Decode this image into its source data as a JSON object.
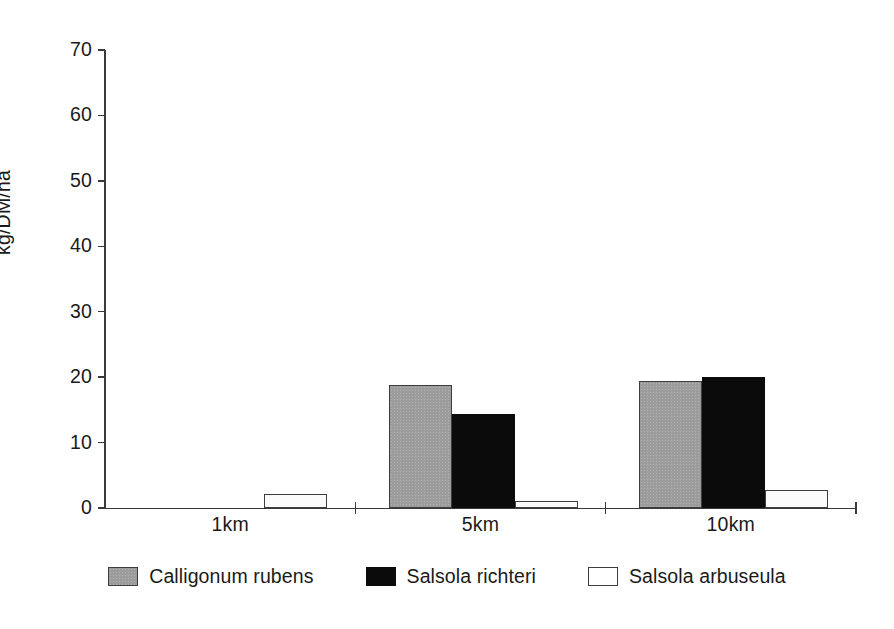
{
  "chart_data": {
    "type": "bar",
    "title": "",
    "xlabel": "",
    "ylabel": "kg/DM/ha",
    "categories": [
      "1km",
      "5km",
      "10km"
    ],
    "series": [
      {
        "name": "Calligonum rubens",
        "color": "#9c9c9c",
        "values": [
          0,
          18.8,
          19.4
        ]
      },
      {
        "name": "Salsola richteri",
        "color": "#0b0b0b",
        "values": [
          0,
          14.3,
          20.0
        ]
      },
      {
        "name": "Salsola arbuseula",
        "color": "#ffffff",
        "values": [
          2.2,
          1.1,
          2.8
        ]
      }
    ],
    "ylim": [
      0,
      70
    ],
    "yticks": [
      0,
      10,
      20,
      30,
      40,
      50,
      60,
      70
    ],
    "ytick_labels": [
      "0",
      "10",
      "20",
      "30",
      "40",
      "50",
      "60",
      "70"
    ],
    "grid": false,
    "legend_position": "bottom",
    "annotations": []
  },
  "axis": {
    "y_title": "kg/DM/ha",
    "tick_labels": [
      "70",
      "60",
      "50",
      "40",
      "30",
      "20",
      "10",
      "0"
    ],
    "group_labels": [
      "1km",
      "5km",
      "10km"
    ]
  },
  "legend": {
    "items": [
      {
        "label": "Calligonum rubens",
        "swatch": "gray-square-icon"
      },
      {
        "label": "Salsola richteri",
        "swatch": "black-square-icon"
      },
      {
        "label": "Salsola arbuseula",
        "swatch": "white-square-icon"
      }
    ]
  }
}
